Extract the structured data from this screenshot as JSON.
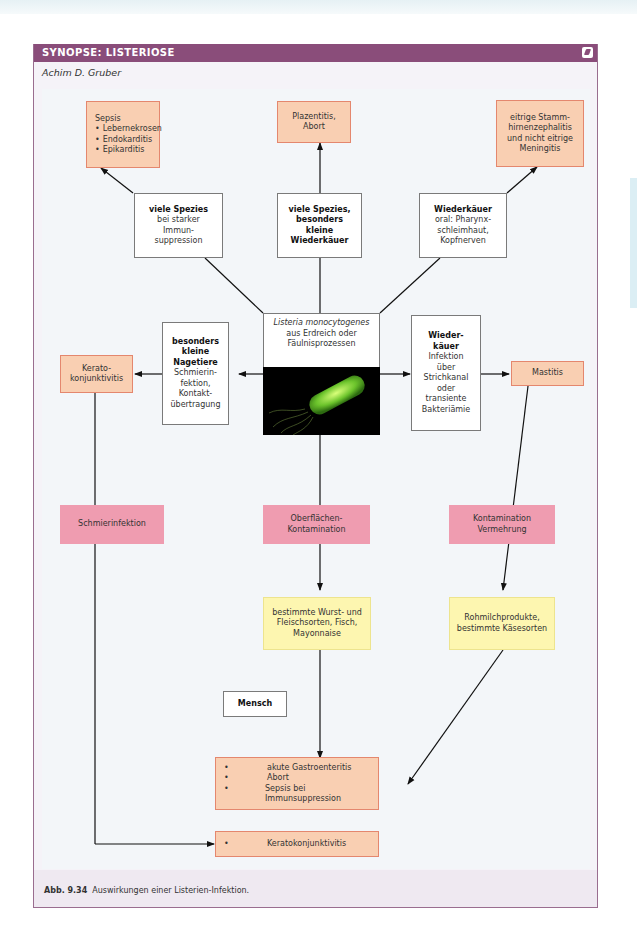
{
  "panel": {
    "title": "SYNOPSE: LISTERIOSE",
    "author": "Achim D. Gruber",
    "icon": "note-icon"
  },
  "center": {
    "species": "Listeria monocytogenes",
    "line2": "aus Erdreich oder",
    "line3": "Fäulnisprozessen",
    "image": "bacterium-image"
  },
  "branches": {
    "upper_left": {
      "bold": "viele Spezies",
      "text": [
        "bei starker",
        "Immun-",
        "suppression"
      ]
    },
    "upper_mid": {
      "bold": [
        "viele Spezies,",
        "besonders",
        "kleine",
        "Wiederkäuer"
      ]
    },
    "upper_right": {
      "bold": "Wiederkäuer",
      "text": [
        "oral: Pharynx-",
        "schleimhaut,",
        "Kopfnerven"
      ]
    },
    "left": {
      "bold": [
        "besonders",
        "kleine",
        "Nagetiere"
      ],
      "text": [
        "Schmierin-",
        "fektion,",
        "Kontakt-",
        "übertragung"
      ]
    },
    "right": {
      "bold": [
        "Wieder-",
        "käuer"
      ],
      "text": [
        "Infektion",
        "über",
        "Strichkanal",
        "oder",
        "transiente",
        "Bakteriämie"
      ]
    }
  },
  "outcomes": {
    "sepsis": {
      "title": "Sepsis",
      "items": [
        "Lebernekrosen",
        "Endokarditis",
        "Epikarditis"
      ]
    },
    "plazentitis": [
      "Plazentitis,",
      "Abort"
    ],
    "meningitis": [
      "eitrige Stamm-",
      "hirnenzephalitis",
      "und nicht eitrige",
      "Meningitis"
    ],
    "kerato": [
      "Kerato-",
      "konjunktivitis"
    ],
    "mastitis": "Mastitis"
  },
  "routes": {
    "schmier": "Schmierinfektion",
    "oberflaechen": [
      "Oberflächen-",
      "Kontamination"
    ],
    "kontamination": [
      "Kontamination",
      "Vermehrung"
    ]
  },
  "foods": {
    "wurst": [
      "bestimmte Wurst- und",
      "Fleischsorten, Fisch,",
      "Mayonnaise"
    ],
    "rohmilch": [
      "Rohmilchprodukte,",
      "bestimmte Käsesorten"
    ]
  },
  "human": {
    "label": "Mensch",
    "diseases": [
      "akute Gastroenteritis",
      "Abort",
      "Sepsis bei Immunsuppression"
    ],
    "eye": [
      "Keratokonjunktivitis"
    ]
  },
  "caption": {
    "label": "Abb. 9.34",
    "text": "Auswirkungen einer Listerien-Infektion."
  },
  "colors": {
    "header": "#8a4d7a",
    "outcome_fill": "#f9cfb2",
    "outcome_border": "#e4876e",
    "route_fill": "#ef9cb0",
    "food_fill": "#fdf6b0",
    "bacterium": "#7ed23a"
  }
}
